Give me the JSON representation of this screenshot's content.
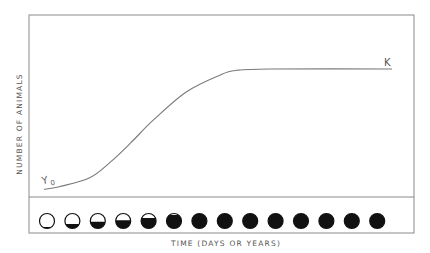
{
  "figure": {
    "y_axis_label": "NUMBER OF ANIMALS",
    "x_axis_label": "TIME (DAYS OR YEARS)",
    "start_label": "Y",
    "start_subscript": "0",
    "capacity_label": "K"
  },
  "colors": {
    "frame": "#8a8a8a",
    "curve": "#7a7a7a",
    "text": "#555555",
    "indicator_fill": "#111111",
    "background": "#ffffff"
  },
  "chart_data": {
    "type": "line",
    "title": "",
    "xlabel": "TIME (DAYS OR YEARS)",
    "ylabel": "NUMBER OF ANIMALS",
    "y_units": "fraction of carrying capacity K (no numeric ticks shown)",
    "x_units": "relative time steps (no numeric ticks shown)",
    "grid": false,
    "legend": null,
    "xlim": [
      -0.6,
      14.6
    ],
    "ylim": [
      0,
      1.42
    ],
    "series": [
      {
        "name": "logistic population growth",
        "x": [
          0,
          0.6,
          1.8,
          2.6,
          3.4,
          4.3,
          5.6,
          6.9,
          7.6,
          8.9,
          13.7
        ],
        "y": [
          0.06,
          0.08,
          0.15,
          0.27,
          0.42,
          0.6,
          0.82,
          0.95,
          0.99,
          1.0,
          1.0
        ]
      }
    ],
    "annotations": [
      {
        "text": "Y0",
        "position": "curve start (initial population)"
      },
      {
        "text": "K",
        "position": "curve plateau (carrying capacity)"
      }
    ],
    "fill_indicators": {
      "description": "row of 14 circles below the plot, filled from the bottom to show population level over time",
      "fractions": [
        0.1,
        0.3,
        0.45,
        0.55,
        0.7,
        0.9,
        1,
        1,
        1,
        1,
        1,
        1,
        1,
        1
      ]
    }
  }
}
